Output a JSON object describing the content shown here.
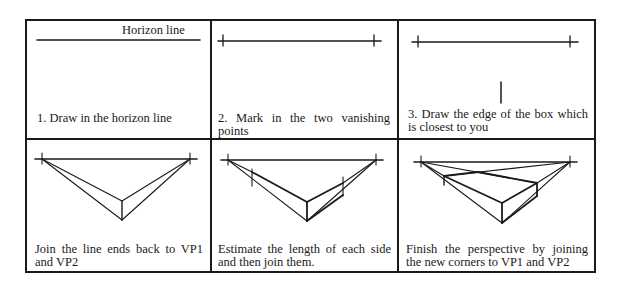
{
  "figure": {
    "panels": [
      {
        "id": 1,
        "label": "Horizon line",
        "caption": "1. Draw in the horizon line"
      },
      {
        "id": 2,
        "caption": "2. Mark in the two vanishing points"
      },
      {
        "id": 3,
        "caption": "3. Draw the edge of the box which is closest to you"
      },
      {
        "id": 4,
        "caption": "Join the line ends back to VP1 and VP2"
      },
      {
        "id": 5,
        "caption": "Estimate the length of each side and then join them."
      },
      {
        "id": 6,
        "caption": "Finish the perspective by joining the new corners to VP1 and VP2"
      }
    ],
    "line_color": "#1a1a1a"
  }
}
